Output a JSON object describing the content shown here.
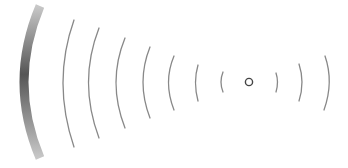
{
  "diagram": {
    "type": "signal-wave-illustration",
    "background": "#ffffff",
    "source_point": {
      "cx": 249,
      "cy": 82,
      "r": 3.6,
      "stroke": "#444444",
      "stroke_width": 1.4
    },
    "reflector": {
      "x1": 40,
      "y1": 6,
      "cx": 8,
      "cy": 82,
      "x2": 40,
      "y2": 158,
      "stroke_dark": "#555555",
      "stroke_light": "#c8c8c8",
      "width": 9
    },
    "left_waves": [
      {
        "x1": 74,
        "y1": 20,
        "cx": 52,
        "cy": 82,
        "x2": 74,
        "y2": 147
      },
      {
        "x1": 99,
        "y1": 28,
        "cx": 78,
        "cy": 82,
        "x2": 99,
        "y2": 138
      },
      {
        "x1": 125,
        "y1": 38,
        "cx": 107,
        "cy": 82,
        "x2": 125,
        "y2": 128
      },
      {
        "x1": 150,
        "y1": 47,
        "cx": 136,
        "cy": 82,
        "x2": 150,
        "y2": 118
      },
      {
        "x1": 174,
        "y1": 56,
        "cx": 163,
        "cy": 82,
        "x2": 174,
        "y2": 110
      },
      {
        "x1": 198,
        "y1": 65,
        "cx": 193,
        "cy": 82,
        "x2": 198,
        "y2": 101
      },
      {
        "x1": 223,
        "y1": 72,
        "cx": 219,
        "cy": 82,
        "x2": 223,
        "y2": 92
      }
    ],
    "right_waves": [
      {
        "x1": 276,
        "y1": 73,
        "cx": 279,
        "cy": 82,
        "x2": 276,
        "y2": 92
      },
      {
        "x1": 299,
        "y1": 64,
        "cx": 305,
        "cy": 82,
        "x2": 299,
        "y2": 101
      },
      {
        "x1": 325,
        "y1": 56,
        "cx": 334,
        "cy": 82,
        "x2": 324,
        "y2": 110
      }
    ],
    "wave_stroke": "#888888",
    "wave_stroke_width": 1.3
  }
}
